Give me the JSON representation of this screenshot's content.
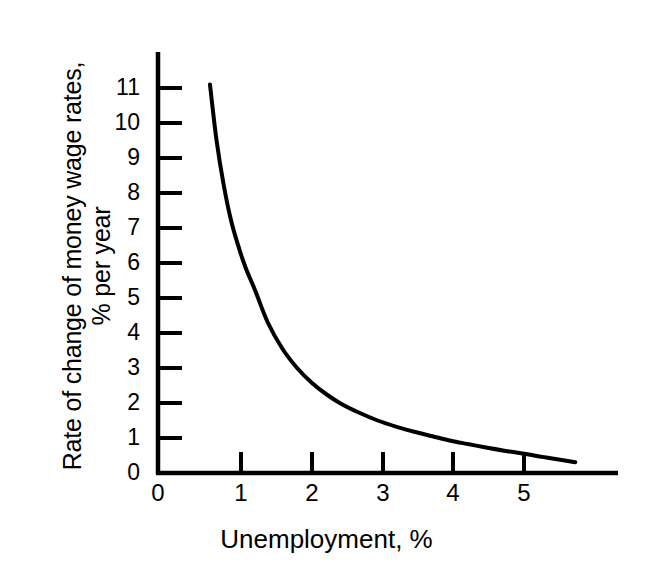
{
  "figure": {
    "background_color": "#ffffff",
    "ink_color": "#000000"
  },
  "chart_data": {
    "type": "line",
    "title": "",
    "subtitle": "",
    "xlabel": "Unemployment, %",
    "ylabel": "Rate of change of money wage rates, % per year",
    "ylabel_lines": [
      "Rate of change of money wage rates,",
      "% per year"
    ],
    "xlim": [
      0,
      6.6
    ],
    "ylim": [
      0,
      12.0
    ],
    "xticks": [
      0,
      1,
      2,
      3,
      4,
      5
    ],
    "xticklabels": [
      "0",
      "1",
      "2",
      "3",
      "4",
      "5"
    ],
    "yticks": [
      0,
      1,
      2,
      3,
      4,
      5,
      6,
      7,
      8,
      9,
      10,
      11
    ],
    "yticklabels": [
      "0",
      "1",
      "2",
      "3",
      "4",
      "5",
      "6",
      "7",
      "8",
      "9",
      "10",
      "11"
    ],
    "grid": false,
    "legend": null,
    "legend_position": "none",
    "annotations": [],
    "series": [
      {
        "name": "Phillips curve",
        "line_color": "#000000",
        "line_width": 4,
        "x": [
          0.71,
          0.8,
          0.9,
          1.0,
          1.11,
          1.2,
          1.33,
          1.5,
          1.7,
          1.9,
          2.1,
          2.3,
          2.5,
          2.75,
          3.0,
          3.26,
          3.5,
          3.75,
          4.0,
          4.25,
          4.5,
          4.75,
          5.0,
          5.25,
          5.45,
          5.7
        ],
        "y": [
          11.1,
          9.5,
          8.2,
          7.2,
          6.4,
          5.85,
          5.2,
          4.3,
          3.55,
          3.0,
          2.58,
          2.25,
          1.98,
          1.72,
          1.5,
          1.32,
          1.18,
          1.05,
          0.92,
          0.82,
          0.72,
          0.63,
          0.55,
          0.46,
          0.39,
          0.31
        ]
      }
    ]
  },
  "axes": {
    "x_axis_name": "x-axis",
    "y_axis_name": "y-axis",
    "tick_direction": "inward"
  }
}
